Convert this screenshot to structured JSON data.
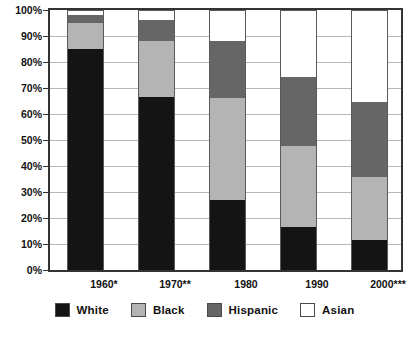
{
  "chart_data": {
    "type": "bar",
    "stacked": true,
    "normalized_percent": true,
    "title": "",
    "subtitle": "",
    "xlabel": "",
    "ylabel": "",
    "ylim": [
      0,
      100
    ],
    "ytick_labels": [
      "0%",
      "10%",
      "20%",
      "30%",
      "40%",
      "50%",
      "60%",
      "70%",
      "80%",
      "90%",
      "100%"
    ],
    "ytick_values": [
      0,
      10,
      20,
      30,
      40,
      50,
      60,
      70,
      80,
      90,
      100
    ],
    "grid": true,
    "legend_position": "bottom",
    "categories": [
      "1960*",
      "1970**",
      "1980",
      "1990",
      "2000***"
    ],
    "series": [
      {
        "name": "White",
        "color": "#141414",
        "values": [
          85.0,
          66.5,
          27.0,
          16.7,
          11.7
        ]
      },
      {
        "name": "Black",
        "color": "#b4b4b4",
        "values": [
          10.0,
          21.5,
          39.0,
          31.0,
          24.0
        ]
      },
      {
        "name": "Hispanic",
        "color": "#666666",
        "values": [
          3.0,
          8.0,
          22.0,
          26.5,
          29.0
        ]
      },
      {
        "name": "Asian",
        "color": "#ffffff",
        "values": [
          2.0,
          4.0,
          12.0,
          25.8,
          35.3
        ]
      }
    ],
    "annotations": []
  },
  "legend": {
    "items": [
      {
        "label": "White"
      },
      {
        "label": "Black"
      },
      {
        "label": "Hispanic"
      },
      {
        "label": "Asian"
      }
    ]
  }
}
